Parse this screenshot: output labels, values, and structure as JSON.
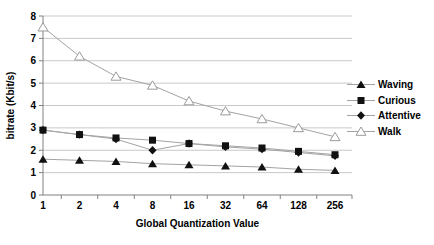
{
  "chart_data": {
    "type": "line",
    "title": "",
    "xlabel": "Global Quantization Value",
    "ylabel": "bitrate (Kbit/s)",
    "x_scale": "log2-categorical",
    "x": [
      1,
      2,
      4,
      8,
      16,
      32,
      64,
      128,
      256
    ],
    "x_tick_labels": [
      "1",
      "2",
      "4",
      "8",
      "16",
      "32",
      "64",
      "128",
      "256"
    ],
    "y_tick_labels": [
      "0",
      "1",
      "2",
      "3",
      "4",
      "5",
      "6",
      "7",
      "8"
    ],
    "ylim": [
      0,
      8
    ],
    "grid": "horizontal",
    "legend_position": "right",
    "colors": {
      "marker": "#111111",
      "series_line": "#a3a3a3",
      "gridline": "#c9c9c9",
      "axis": "#808080",
      "open_marker_stroke": "#9b9b9b",
      "open_marker_fill": "#ffffff",
      "background": "#ffffff",
      "text": "#000000"
    },
    "series": [
      {
        "name": "Waving",
        "marker": "filled-triangle",
        "values": [
          1.6,
          1.55,
          1.5,
          1.4,
          1.35,
          1.3,
          1.25,
          1.15,
          1.1
        ]
      },
      {
        "name": "Curious",
        "marker": "filled-square",
        "values": [
          2.9,
          2.7,
          2.55,
          2.45,
          2.3,
          2.2,
          2.1,
          1.95,
          1.8
        ]
      },
      {
        "name": "Attentive",
        "marker": "filled-diamond",
        "values": [
          2.9,
          2.7,
          2.5,
          2.0,
          2.3,
          2.15,
          2.05,
          1.9,
          1.75
        ]
      },
      {
        "name": "Walk",
        "marker": "open-triangle",
        "values": [
          7.5,
          6.2,
          5.3,
          4.9,
          4.2,
          3.75,
          3.4,
          3.0,
          2.6
        ]
      }
    ]
  }
}
